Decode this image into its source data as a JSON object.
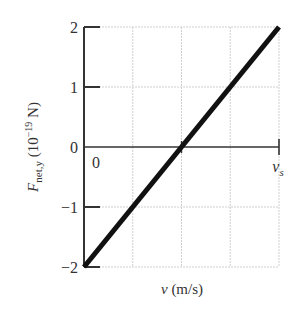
{
  "chart_data": {
    "type": "line",
    "title": "",
    "xlabel": "v (m/s)",
    "xlabel_parts": {
      "var": "v",
      "unit": " (m/s)"
    },
    "ylabel": "F_net,y (10^-19 N)",
    "ylabel_parts": {
      "var": "F",
      "sub": "net,y",
      "pre": " (10",
      "exp": "−19",
      "post": " N)"
    },
    "x_ticks": [
      {
        "value": 0,
        "label": "0"
      },
      {
        "value": 4,
        "label": "v_s",
        "display_var": "v",
        "display_sub": "s"
      }
    ],
    "y_ticks": [
      {
        "value": 2,
        "label": "2"
      },
      {
        "value": 1,
        "label": "1"
      },
      {
        "value": 0,
        "label": "0"
      },
      {
        "value": -1,
        "label": "−1"
      },
      {
        "value": -2,
        "label": "−2"
      }
    ],
    "xlim": [
      0,
      4
    ],
    "x_units_note": "x axis in units of v_s/4 (v_s at 4)",
    "ylim": [
      -2,
      2
    ],
    "grid": true,
    "x_grid": [
      1,
      2,
      3,
      4
    ],
    "y_grid": [
      -2,
      -1,
      1,
      2
    ],
    "series": [
      {
        "name": "F_net,y vs v",
        "x": [
          0,
          2,
          4
        ],
        "y": [
          -2,
          0,
          2
        ]
      }
    ]
  }
}
